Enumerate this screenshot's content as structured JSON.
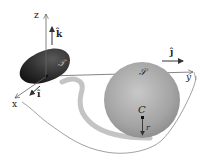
{
  "diagram": {
    "axes": {
      "x_label": "x",
      "y_label": "y",
      "z_label": "z"
    },
    "unit_vectors": {
      "i_label": "î",
      "j_label": "ĵ",
      "k_label": "k̂"
    },
    "bodies": {
      "irregular_body_label": "𝒯",
      "sphere_label": "𝒮",
      "sphere_center_label": "C",
      "sphere_radius_label": "r"
    },
    "colors": {
      "irregular_body": "#2b2b2b",
      "sphere": "#a9a9a9",
      "track": "#c4c4c4",
      "lines": "#555555"
    }
  }
}
